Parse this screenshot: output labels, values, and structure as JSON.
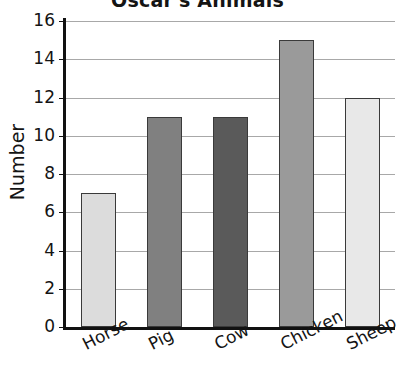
{
  "chart_data": {
    "type": "bar",
    "title": "Oscar's Animals",
    "xlabel": "",
    "ylabel": "Number",
    "categories": [
      "Horse",
      "Pig",
      "Cow",
      "Chicken",
      "Sheep"
    ],
    "values": [
      7,
      11,
      11,
      15,
      12
    ],
    "bar_colors": [
      "#dcdcdc",
      "#808080",
      "#5a5a5a",
      "#9a9a9a",
      "#e8e8e8"
    ],
    "bar_border_color": "#3a3a3a",
    "ylim": [
      0,
      16
    ],
    "yticks": [
      0,
      2,
      4,
      6,
      8,
      10,
      12,
      14,
      16
    ],
    "ytick_labels": [
      "0",
      "2",
      "4",
      "6",
      "8",
      "10",
      "12",
      "14",
      "16"
    ],
    "grid": true,
    "gridline_color": "#a8a8a8",
    "legend": null,
    "axis_color": "#111111",
    "background": "#ffffff"
  }
}
